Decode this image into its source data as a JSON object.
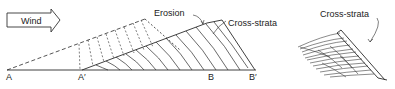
{
  "diagram": {
    "wind_label": "Wind",
    "left_figure": {
      "erosion_label": "Erosion",
      "cross_strata_label": "Cross-strata",
      "points": {
        "a": "A",
        "a_prime": "A′",
        "b": "B",
        "b_prime": "B′"
      }
    },
    "right_figure": {
      "cross_strata_label": "Cross-strata"
    },
    "colors": {
      "line": "#2a2a2a",
      "background": "#ffffff"
    }
  }
}
